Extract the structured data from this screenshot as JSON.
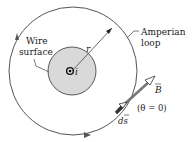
{
  "figure": {
    "labels": {
      "wire_surface_line1": "Wire",
      "wire_surface_line2": "surface",
      "amperian_line1": "Amperian",
      "amperian_line2": "loop",
      "radius": "r",
      "current": "i",
      "field": "B",
      "path_element": "ds",
      "angle_note": "(θ = 0)"
    },
    "colors": {
      "wire_fill": "#d9d9d9",
      "loop_stroke": "#555555",
      "vector_stroke": "#6a6a6a",
      "text": "#1a1a1a"
    }
  }
}
